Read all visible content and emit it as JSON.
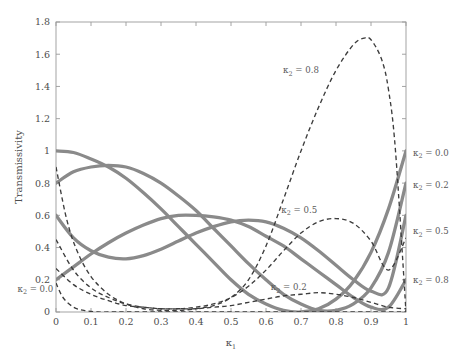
{
  "chart_data": {
    "type": "line",
    "title": "",
    "xlabel": "κ₁",
    "ylabel": "Transmissivity",
    "xlim": [
      0,
      1
    ],
    "ylim": [
      0,
      1.8
    ],
    "xticks": [
      "0",
      "0.1",
      "0.2",
      "0.3",
      "0.4",
      "0.5",
      "0.6",
      "0.7",
      "0.8",
      "0.9",
      "1"
    ],
    "xtick_values": [
      0,
      0.1,
      0.2,
      0.3,
      0.4,
      0.5,
      0.6,
      0.7,
      0.8,
      0.9,
      1
    ],
    "yticks": [
      "0",
      "0.2",
      "0.4",
      "0.6",
      "0.8",
      "1",
      "1.2",
      "1.4",
      "1.6",
      "1.8"
    ],
    "ytick_values": [
      0,
      0.2,
      0.4,
      0.6,
      0.8,
      1.0,
      1.2,
      1.4,
      1.6,
      1.8
    ],
    "grid": false,
    "legend_position": "inline-annotations",
    "colors": {
      "solid_curve": "#8a8a8a",
      "dashed_curve": "#3d3d3d",
      "axis": "#9a9a9a",
      "text": "#4d4d4d"
    },
    "series": [
      {
        "name": "solid-1",
        "style": "solid",
        "color": "#8a8a8a",
        "x": [
          0,
          0.05,
          0.1,
          0.15,
          0.2,
          0.25,
          0.3,
          0.35,
          0.4,
          0.45,
          0.5,
          0.55,
          0.6,
          0.65,
          0.7,
          0.75,
          0.8,
          0.85,
          0.9,
          0.95,
          1
        ],
        "values": [
          1.0,
          0.99,
          0.95,
          0.9,
          0.83,
          0.74,
          0.64,
          0.53,
          0.42,
          0.31,
          0.2,
          0.11,
          0.05,
          0.01,
          0.0,
          0.02,
          0.08,
          0.19,
          0.37,
          0.64,
          1.0
        ]
      },
      {
        "name": "solid-2",
        "style": "solid",
        "color": "#8a8a8a",
        "x": [
          0,
          0.05,
          0.1,
          0.15,
          0.2,
          0.25,
          0.3,
          0.35,
          0.4,
          0.45,
          0.5,
          0.55,
          0.6,
          0.65,
          0.7,
          0.75,
          0.8,
          0.85,
          0.9,
          0.95,
          1
        ],
        "values": [
          0.8,
          0.87,
          0.9,
          0.91,
          0.9,
          0.86,
          0.8,
          0.72,
          0.63,
          0.52,
          0.41,
          0.3,
          0.2,
          0.11,
          0.05,
          0.01,
          0.01,
          0.05,
          0.15,
          0.37,
          0.8
        ]
      },
      {
        "name": "solid-3",
        "style": "solid",
        "color": "#8a8a8a",
        "x": [
          0,
          0.05,
          0.1,
          0.15,
          0.2,
          0.25,
          0.3,
          0.35,
          0.4,
          0.45,
          0.5,
          0.55,
          0.6,
          0.65,
          0.7,
          0.75,
          0.8,
          0.85,
          0.9,
          0.95,
          1
        ],
        "values": [
          0.6,
          0.46,
          0.38,
          0.34,
          0.33,
          0.35,
          0.39,
          0.44,
          0.49,
          0.53,
          0.56,
          0.57,
          0.56,
          0.52,
          0.46,
          0.38,
          0.29,
          0.2,
          0.13,
          0.15,
          0.6
        ]
      },
      {
        "name": "solid-4",
        "style": "solid",
        "color": "#8a8a8a",
        "x": [
          0,
          0.05,
          0.1,
          0.15,
          0.2,
          0.25,
          0.3,
          0.35,
          0.4,
          0.45,
          0.5,
          0.55,
          0.6,
          0.65,
          0.7,
          0.75,
          0.8,
          0.85,
          0.9,
          0.95,
          1
        ],
        "values": [
          0.2,
          0.28,
          0.36,
          0.43,
          0.49,
          0.54,
          0.58,
          0.6,
          0.6,
          0.59,
          0.57,
          0.53,
          0.47,
          0.41,
          0.33,
          0.25,
          0.17,
          0.09,
          0.03,
          0.03,
          0.2
        ]
      },
      {
        "name": "κ₂ = 0.0",
        "style": "dashed",
        "color": "#3d3d3d",
        "x": [
          0,
          0.02,
          0.05,
          0.08,
          0.12,
          0.16,
          0.2,
          0.3,
          0.4,
          0.5,
          0.6,
          0.7,
          0.8,
          0.9,
          1
        ],
        "values": [
          0.18,
          0.09,
          0.03,
          0.01,
          0.0,
          0.0,
          0.0,
          0.0,
          0.0,
          0.0,
          0.0,
          0.0,
          0.0,
          0.0,
          0.0
        ]
      },
      {
        "name": "κ₂ = 0.2",
        "style": "dashed",
        "color": "#3d3d3d",
        "x": [
          0,
          0.05,
          0.1,
          0.15,
          0.2,
          0.25,
          0.3,
          0.35,
          0.4,
          0.45,
          0.5,
          0.55,
          0.6,
          0.65,
          0.7,
          0.75,
          0.8,
          0.85,
          0.9,
          0.95,
          1
        ],
        "values": [
          0.27,
          0.17,
          0.11,
          0.07,
          0.04,
          0.03,
          0.02,
          0.02,
          0.02,
          0.03,
          0.04,
          0.06,
          0.08,
          0.1,
          0.11,
          0.12,
          0.11,
          0.09,
          0.06,
          0.03,
          0.02
        ]
      },
      {
        "name": "κ₂ = 0.5",
        "style": "dashed",
        "color": "#3d3d3d",
        "x": [
          0,
          0.05,
          0.1,
          0.15,
          0.2,
          0.25,
          0.3,
          0.35,
          0.4,
          0.45,
          0.5,
          0.55,
          0.6,
          0.65,
          0.7,
          0.75,
          0.8,
          0.85,
          0.9,
          0.95,
          1
        ],
        "values": [
          0.45,
          0.26,
          0.15,
          0.09,
          0.05,
          0.03,
          0.02,
          0.02,
          0.03,
          0.05,
          0.09,
          0.16,
          0.26,
          0.38,
          0.49,
          0.56,
          0.58,
          0.55,
          0.44,
          0.26,
          0.46
        ]
      },
      {
        "name": "κ₂ = 0.8",
        "style": "dashed",
        "color": "#3d3d3d",
        "x": [
          0,
          0.03,
          0.06,
          0.1,
          0.15,
          0.2,
          0.25,
          0.3,
          0.35,
          0.4,
          0.45,
          0.5,
          0.55,
          0.6,
          0.65,
          0.7,
          0.75,
          0.8,
          0.85,
          0.88,
          0.9,
          0.93,
          0.95,
          0.97,
          1
        ],
        "values": [
          0.9,
          0.58,
          0.38,
          0.22,
          0.11,
          0.05,
          0.02,
          0.01,
          0.01,
          0.02,
          0.04,
          0.09,
          0.2,
          0.41,
          0.7,
          1.0,
          1.27,
          1.5,
          1.66,
          1.7,
          1.69,
          1.57,
          1.38,
          1.0,
          0.0
        ]
      }
    ],
    "annotations": [
      {
        "text": "κ₂ = 0.8",
        "x": 0.7,
        "y": 1.5,
        "place": "inside"
      },
      {
        "text": "κ₂ = 0.5",
        "x": 0.695,
        "y": 0.635,
        "place": "inside"
      },
      {
        "text": "κ₂ = 0.2",
        "x": 0.665,
        "y": 0.155,
        "place": "inside"
      },
      {
        "text": "κ₂ = 0.0",
        "x": -0.11,
        "y": 0.145,
        "place": "outside-left"
      },
      {
        "text": "κ₂ = 0.0",
        "x": 1.02,
        "y": 0.99,
        "place": "outside-right"
      },
      {
        "text": "κ₂ = 0.2",
        "x": 1.02,
        "y": 0.79,
        "place": "outside-right"
      },
      {
        "text": "κ₂ = 0.5",
        "x": 1.02,
        "y": 0.5,
        "place": "outside-right"
      },
      {
        "text": "κ₂ = 0.8",
        "x": 1.02,
        "y": 0.2,
        "place": "outside-right"
      }
    ]
  },
  "axis": {
    "ylabel": "Transmissivity",
    "xlabel_base": "κ",
    "xlabel_sub": "1"
  }
}
